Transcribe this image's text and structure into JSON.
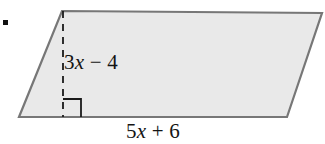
{
  "figure": {
    "kind": "parallelogram-with-height",
    "background_color": "#ffffff",
    "fill_color": "#e9e9e9",
    "stroke_color": "#777777",
    "dash_color": "#1a1a1a",
    "text_color": "#141414",
    "bullet": {
      "name": "exercise-bullet",
      "color": "#111111"
    },
    "vertices": {
      "top_left": [
        62,
        11
      ],
      "top_right": [
        322,
        13
      ],
      "bottom_right": [
        287,
        117
      ],
      "bottom_left": [
        19,
        117
      ]
    },
    "height_segment": {
      "x": 63,
      "y_top": 11,
      "y_bottom": 117,
      "style": "dashed"
    },
    "right_angle_marker": {
      "x": 63,
      "y": 99,
      "size": 18
    },
    "labels": {
      "height": {
        "text": "3x − 4",
        "parts": [
          {
            "t": "3",
            "italic": false
          },
          {
            "t": "x",
            "italic": true
          },
          {
            "t": " − 4",
            "italic": false
          }
        ]
      },
      "base": {
        "text": "5x + 6",
        "parts": [
          {
            "t": "5",
            "italic": false
          },
          {
            "t": "x",
            "italic": true
          },
          {
            "t": " + 6",
            "italic": false
          }
        ]
      }
    }
  }
}
